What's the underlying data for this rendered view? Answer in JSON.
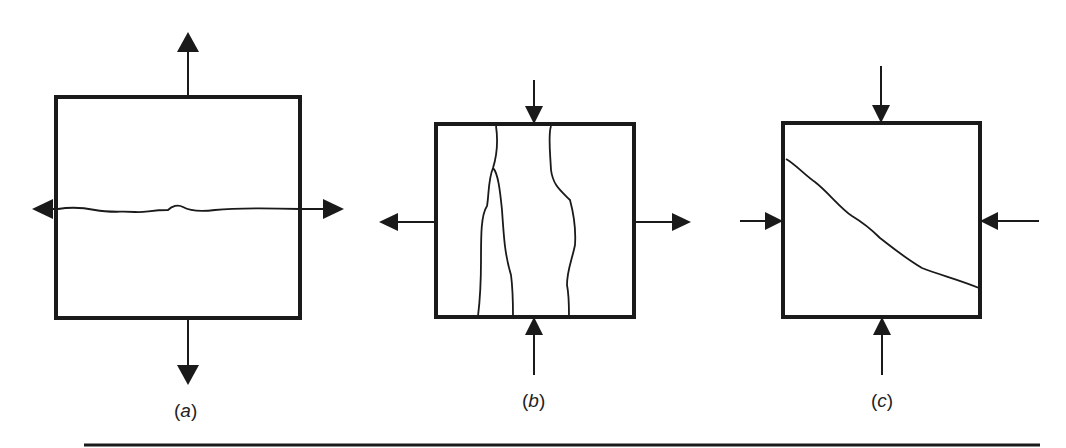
{
  "figure": {
    "panels": [
      {
        "id": "a",
        "label_open": "(",
        "letter": "a",
        "label_close": ")",
        "loading": "biaxial tension",
        "crack": "horizontal crack perpendicular to vertical tension"
      },
      {
        "id": "b",
        "label_open": "(",
        "letter": "b",
        "label_close": ")",
        "loading": "vertical compression with lateral tension",
        "crack": "vertical splitting cracks"
      },
      {
        "id": "c",
        "label_open": "(",
        "letter": "c",
        "label_close": ")",
        "loading": "biaxial compression",
        "crack": "inclined shear crack"
      }
    ],
    "colors": {
      "stroke": "#1a1a1a",
      "background": "#ffffff"
    }
  }
}
